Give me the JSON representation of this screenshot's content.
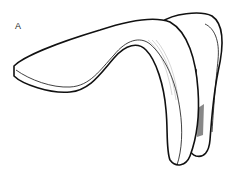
{
  "figure": {
    "panel_label": "A",
    "style": "black-outline line drawing with grey shading",
    "colors": {
      "outline": "#111111",
      "fill": "#ffffff",
      "shade_dark": "#555555",
      "shade_light": "#bbbbbb"
    }
  }
}
